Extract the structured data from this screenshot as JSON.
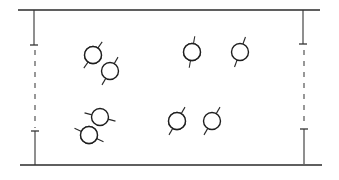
{
  "diagram": {
    "colors": {
      "ink": "#1e1e1e",
      "fill": "#0d0d0d",
      "background": "#ffffff"
    },
    "walls": [
      {
        "name": "top-wall"
      },
      {
        "name": "bottom-wall"
      }
    ],
    "boundaries": [
      {
        "name": "left-periodic-boundary",
        "style": "solid-dashed-solid"
      },
      {
        "name": "right-periodic-boundary",
        "style": "solid-dashed-solid"
      }
    ],
    "particles": [
      {
        "id": 1,
        "type": "filled",
        "fill_pattern": "diagonal-band",
        "orientation_deg": -55
      },
      {
        "id": 2,
        "type": "open",
        "fill_pattern": "none",
        "orientation_deg": -60
      },
      {
        "id": 3,
        "type": "filled",
        "fill_pattern": "vertical-half",
        "orientation_deg": -80
      },
      {
        "id": 4,
        "type": "open",
        "fill_pattern": "none",
        "orientation_deg": -70
      },
      {
        "id": 5,
        "type": "open",
        "fill_pattern": "none",
        "orientation_deg": 15
      },
      {
        "id": 6,
        "type": "filled",
        "fill_pattern": "diagonal-band",
        "orientation_deg": 25
      },
      {
        "id": 7,
        "type": "filled",
        "fill_pattern": "diagonal-half",
        "orientation_deg": -60
      },
      {
        "id": 8,
        "type": "open",
        "fill_pattern": "none",
        "orientation_deg": -60
      }
    ]
  }
}
